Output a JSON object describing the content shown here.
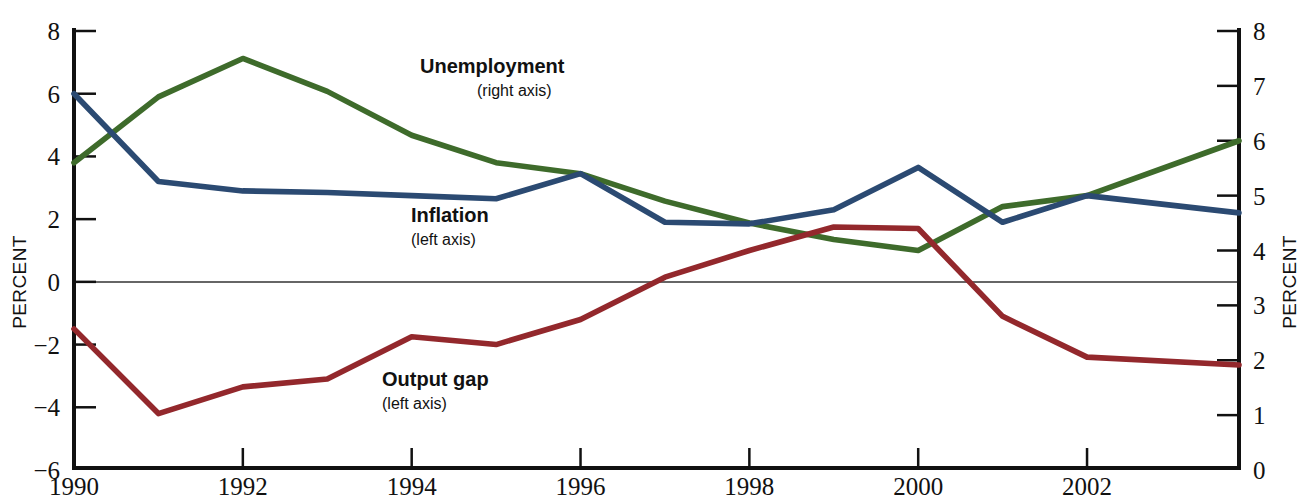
{
  "chart_data": {
    "type": "line",
    "title": "",
    "xlabel": "",
    "ylabel": "PERCENT",
    "ylabel_right": "PERCENT",
    "x": [
      1990,
      1991,
      1992,
      1993,
      1994,
      1995,
      1996,
      1997,
      1998,
      1999,
      2000,
      2001,
      2002,
      2003.8
    ],
    "xlim": [
      1990,
      2003.8
    ],
    "xticks": [
      1990,
      1992,
      1994,
      1996,
      1998,
      2000,
      2002
    ],
    "xticklabels": [
      "1990",
      "1992",
      "1994",
      "1996",
      "1998",
      "2000",
      "2002"
    ],
    "ylim": [
      -6,
      8
    ],
    "yticks": [
      -6,
      -4,
      -2,
      0,
      2,
      4,
      6,
      8
    ],
    "yticklabels": [
      "−6",
      "−4",
      "−2",
      "0",
      "2",
      "4",
      "6",
      "8"
    ],
    "ylim_right": [
      0,
      8
    ],
    "yticks_right": [
      0,
      1,
      2,
      3,
      4,
      5,
      6,
      7,
      8
    ],
    "yticklabels_right": [
      "0",
      "1",
      "2",
      "3",
      "4",
      "5",
      "6",
      "7",
      "8"
    ],
    "grid": false,
    "zero_line": true,
    "legend": "inline-annotations",
    "series": [
      {
        "name": "Unemployment",
        "axis": "right",
        "color": "#3e6b2b",
        "label": "Unemployment",
        "sublabel": "(right axis)",
        "values": [
          5.6,
          6.8,
          7.5,
          6.9,
          6.1,
          5.6,
          5.4,
          4.9,
          4.5,
          4.2,
          4.0,
          4.8,
          5.0,
          6.0
        ]
      },
      {
        "name": "Inflation",
        "axis": "left",
        "color": "#2b4a72",
        "label": "Inflation",
        "sublabel": "(left axis)",
        "values": [
          6.0,
          3.2,
          2.9,
          2.85,
          2.75,
          2.65,
          3.45,
          1.9,
          1.85,
          2.3,
          3.65,
          1.9,
          2.75,
          2.2
        ]
      },
      {
        "name": "Output gap",
        "axis": "left",
        "color": "#93282c",
        "label": "Output gap",
        "sublabel": "(left axis)",
        "values": [
          -1.5,
          -4.2,
          -3.35,
          -3.1,
          -1.75,
          -2.0,
          -1.2,
          0.15,
          1.0,
          1.75,
          1.7,
          -1.1,
          -2.4,
          -2.65
        ]
      }
    ]
  },
  "axes": {
    "left_title": "PERCENT",
    "right_title": "PERCENT"
  },
  "annotations": [
    {
      "id": "unemployment",
      "label": "Unemployment",
      "sublabel": "(right axis)"
    },
    {
      "id": "inflation",
      "label": "Inflation",
      "sublabel": "(left axis)"
    },
    {
      "id": "output-gap",
      "label": "Output gap",
      "sublabel": "(left axis)"
    }
  ]
}
